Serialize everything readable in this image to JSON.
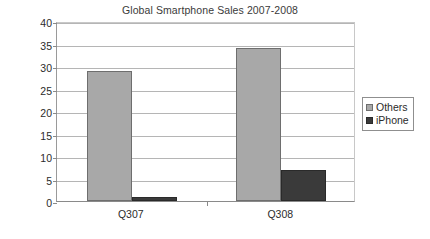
{
  "chart_data": {
    "type": "bar",
    "title": "Global Smartphone Sales 2007-2008",
    "xlabel": "",
    "ylabel": "Million units shipped",
    "categories": [
      "Q307",
      "Q308"
    ],
    "series": [
      {
        "name": "Others",
        "values": [
          29,
          34
        ],
        "color": "#a8a8a8"
      },
      {
        "name": "iPhone",
        "values": [
          1,
          7
        ],
        "color": "#3a3a3a"
      }
    ],
    "ylim": [
      0,
      40
    ],
    "ytick_step": 5,
    "yticks": [
      0,
      5,
      10,
      15,
      20,
      25,
      30,
      35,
      40
    ],
    "ytick_labels": [
      "0",
      "5",
      "10",
      "15",
      "20",
      "25",
      "30",
      "35",
      "40"
    ],
    "grid": true,
    "grid_axis": "y",
    "legend": true,
    "legend_position": "right",
    "legend_entries": [
      "Others",
      "iPhone"
    ],
    "background": "#ffffff"
  }
}
